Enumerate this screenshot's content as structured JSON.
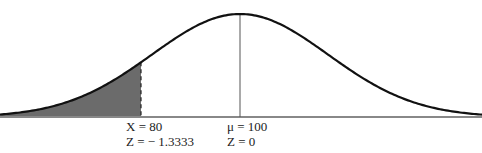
{
  "chart_data": {
    "type": "area",
    "title": "",
    "distribution": {
      "mean": 100,
      "sd": 15
    },
    "shaded_region": {
      "from": "-inf",
      "to": 80,
      "color": "#6b6b6b"
    },
    "annotations": [
      {
        "x_value": 80,
        "z_value": -1.3333,
        "line": "dashed",
        "label_x": "X = 80",
        "label_z": "Z = − 1.3333"
      },
      {
        "x_value": 100,
        "z_value": 0,
        "line": "solid",
        "label_x": "μ = 100",
        "label_z": "Z = 0"
      }
    ],
    "grid": false,
    "xlabel": "",
    "ylabel": ""
  },
  "labels": {
    "x80": "X = 80",
    "z80": "Z = − 1.3333",
    "mu": "μ = 100",
    "z0": "Z = 0"
  },
  "colors": {
    "curve": "#111111",
    "shade": "#6b6b6b",
    "baseline": "#888888"
  }
}
